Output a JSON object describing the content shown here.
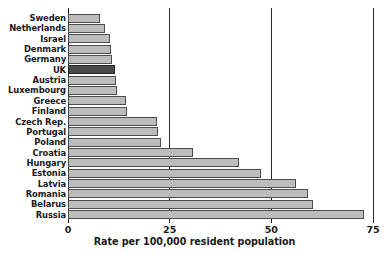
{
  "chart_data": {
    "type": "bar",
    "orientation": "horizontal",
    "title": "",
    "xlabel": "Rate per 100,000 resident population",
    "ylabel": "",
    "xlim": [
      0,
      75
    ],
    "xticks": [
      0,
      25,
      50,
      75
    ],
    "xtick_labels": [
      "0",
      "25",
      "50",
      "75"
    ],
    "grid": true,
    "grid_axis": "x",
    "legend": false,
    "bar_color": "#bcbcbc",
    "bar_edge_color": "#4d4d4d",
    "highlight_color": "#4a4a4a",
    "highlight_category": "UK",
    "categories": [
      "Sweden",
      "Netherlands",
      "Israel",
      "Denmark",
      "Germany",
      "UK",
      "Austria",
      "Luxembourg",
      "Greece",
      "Finland",
      "Czech Rep.",
      "Portugal",
      "Poland",
      "Croatia",
      "Hungary",
      "Estonia",
      "Latvia",
      "Romania",
      "Belarus",
      "Russia"
    ],
    "values": [
      7.9,
      9.1,
      10.3,
      10.6,
      10.8,
      11.6,
      11.8,
      12.0,
      14.3,
      14.5,
      21.9,
      22.1,
      22.9,
      30.7,
      42.0,
      47.5,
      56.1,
      59.0,
      60.2,
      72.8
    ]
  }
}
